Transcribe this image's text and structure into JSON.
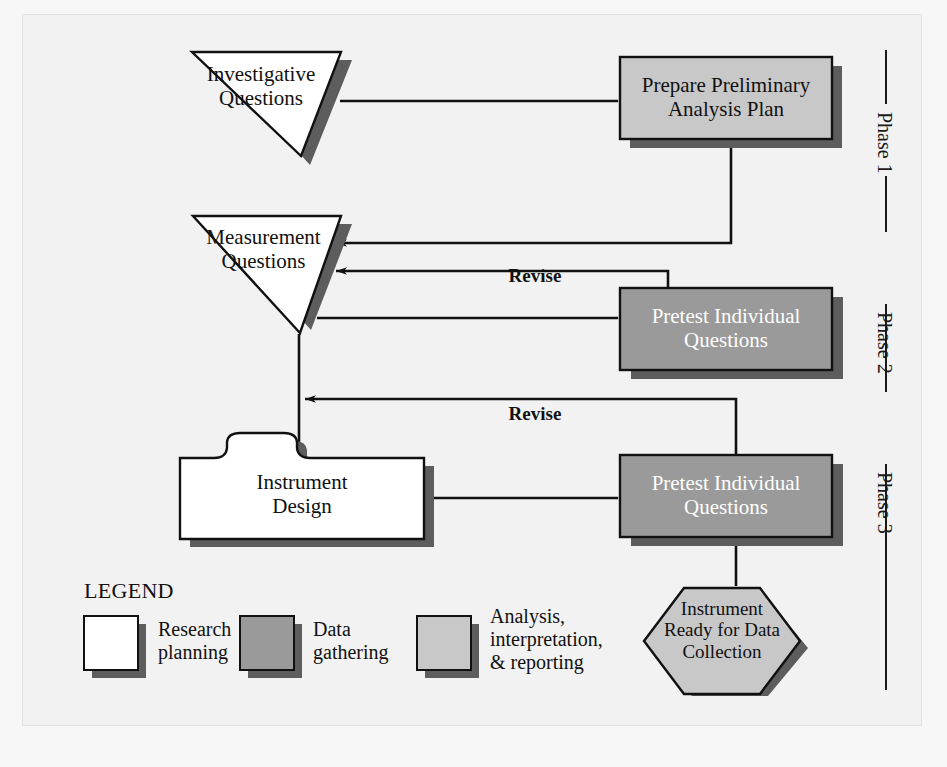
{
  "diagram": {
    "background_color": "#f2f2f2",
    "colors": {
      "research_planning": "#ffffff",
      "data_gathering": "#9a9a9a",
      "analysis_interpretation_reporting": "#c8c8c8",
      "shadow": "#5d5d5d",
      "outline": "#111111",
      "line": "#111111"
    },
    "nodes": [
      {
        "id": "investigative-questions",
        "label": "Investigative\nQuestions",
        "shape": "inverted-triangle",
        "category": "research planning",
        "fill": "#ffffff",
        "text_color": "#111111"
      },
      {
        "id": "prepare-preliminary-analysis-plan",
        "label": "Prepare Preliminary\nAnalysis Plan",
        "shape": "rectangle",
        "category": "analysis, interpretation, & reporting",
        "fill": "#c8c8c8",
        "text_color": "#111111"
      },
      {
        "id": "measurement-questions",
        "label": "Measurement\nQuestions",
        "shape": "inverted-triangle",
        "category": "research planning",
        "fill": "#ffffff",
        "text_color": "#111111"
      },
      {
        "id": "pretest-individual-questions-1",
        "label": "Pretest Individual\nQuestions",
        "shape": "rectangle",
        "category": "data gathering",
        "fill": "#9a9a9a",
        "text_color": "#ffffff"
      },
      {
        "id": "instrument-design",
        "label": "Instrument\nDesign",
        "shape": "tabbed-rectangle",
        "category": "research planning",
        "fill": "#ffffff",
        "text_color": "#111111"
      },
      {
        "id": "pretest-individual-questions-2",
        "label": "Pretest Individual\nQuestions",
        "shape": "rectangle",
        "category": "data gathering",
        "fill": "#9a9a9a",
        "text_color": "#ffffff"
      },
      {
        "id": "instrument-ready-for-data-collection",
        "label": "Instrument\nReady for Data\nCollection",
        "shape": "hexagon",
        "category": "analysis, interpretation, & reporting",
        "fill": "#c8c8c8",
        "text_color": "#111111"
      }
    ],
    "edge_labels": [
      {
        "id": "revise-1",
        "text": "Revise"
      },
      {
        "id": "revise-2",
        "text": "Revise"
      }
    ],
    "phases": [
      {
        "id": "phase-1",
        "label": "Phase 1"
      },
      {
        "id": "phase-2",
        "label": "Phase 2"
      },
      {
        "id": "phase-3",
        "label": "Phase 3"
      }
    ],
    "legend": {
      "title": "LEGEND",
      "items": [
        {
          "id": "legend-research-planning",
          "label": "Research\nplanning",
          "swatch": "#ffffff"
        },
        {
          "id": "legend-data-gathering",
          "label": "Data\ngathering",
          "swatch": "#9a9a9a"
        },
        {
          "id": "legend-analysis",
          "label": "Analysis,\ninterpretation,\n& reporting",
          "swatch": "#c8c8c8"
        }
      ]
    }
  }
}
